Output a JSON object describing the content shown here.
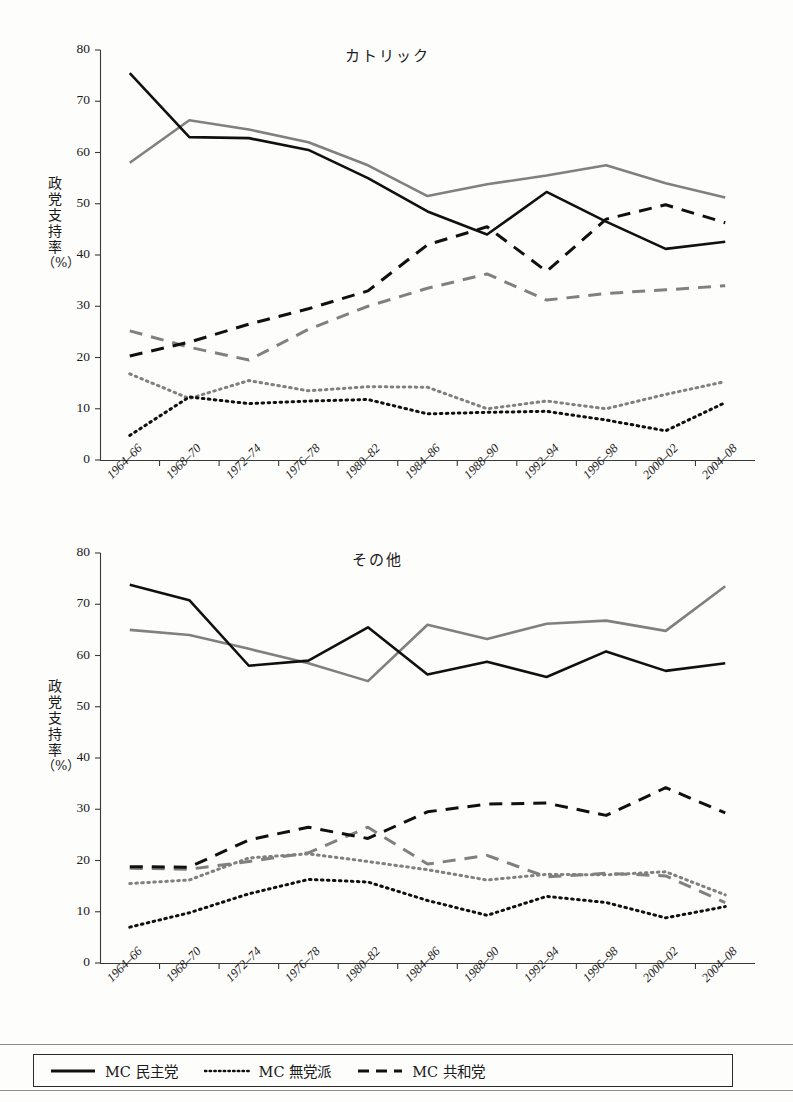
{
  "figure": {
    "axis_color": "#3a3a3a",
    "series_black": "#101010",
    "series_gray": "#808080"
  },
  "legend": {
    "items": [
      {
        "label": "MC 民主党",
        "style": "solid",
        "icon": "solid-line-icon"
      },
      {
        "label": "MC 無党派",
        "style": "dotted",
        "icon": "dotted-line-icon"
      },
      {
        "label": "MC 共和党",
        "style": "dashed",
        "icon": "dashed-line-icon"
      }
    ]
  },
  "axis": {
    "ylabel_chars": [
      "政",
      "党",
      "支",
      "持",
      "率"
    ],
    "ylabel_unit": "（%）",
    "yticks": [
      80,
      70,
      60,
      50,
      40,
      30,
      20,
      10,
      0
    ],
    "categories": [
      "1964–66",
      "1968–70",
      "1972–74",
      "1976–78",
      "1980–82",
      "1984–86",
      "1988–90",
      "1992–94",
      "1996–98",
      "2000–02",
      "2004–08"
    ]
  },
  "chart_data": [
    {
      "type": "line",
      "title": "カトリック",
      "xlabel": "",
      "ylabel": "政党支持率（%）",
      "ylim": [
        0,
        80
      ],
      "xlim_categories": [
        "1964–66",
        "1968–70",
        "1972–74",
        "1976–78",
        "1980–82",
        "1984–86",
        "1988–90",
        "1992–94",
        "1996–98",
        "2000–02",
        "2004–08"
      ],
      "grid": false,
      "legend_position": "below-figure",
      "series": [
        {
          "name": "MC 民主党",
          "group": "black",
          "style": "solid",
          "values": [
            75.5,
            63.0,
            62.8,
            60.5,
            55.0,
            48.5,
            44.0,
            52.3,
            46.5,
            41.2,
            42.6
          ]
        },
        {
          "name": "MC 民主党",
          "group": "gray",
          "style": "solid",
          "values": [
            58.0,
            66.3,
            64.5,
            62.0,
            57.5,
            51.5,
            53.8,
            55.5,
            57.5,
            54.0,
            51.2
          ]
        },
        {
          "name": "MC 共和党",
          "group": "black",
          "style": "dashed",
          "values": [
            20.3,
            23.0,
            26.5,
            29.5,
            33.0,
            42.0,
            45.5,
            36.8,
            47.0,
            49.8,
            46.3
          ]
        },
        {
          "name": "MC 共和党",
          "group": "gray",
          "style": "dashed",
          "values": [
            25.2,
            22.0,
            19.5,
            25.5,
            30.0,
            33.5,
            36.3,
            31.2,
            32.5,
            33.2,
            34.0
          ]
        },
        {
          "name": "MC 無党派",
          "group": "black",
          "style": "dotted",
          "values": [
            4.8,
            12.3,
            11.0,
            11.5,
            11.8,
            9.0,
            9.3,
            9.5,
            7.8,
            5.7,
            11.2
          ]
        },
        {
          "name": "MC 無党派",
          "group": "gray",
          "style": "dotted",
          "values": [
            16.8,
            12.0,
            15.5,
            13.5,
            14.3,
            14.2,
            10.0,
            11.5,
            10.0,
            12.8,
            15.3
          ]
        }
      ]
    },
    {
      "type": "line",
      "title": "その他",
      "xlabel": "",
      "ylabel": "政党支持率（%）",
      "ylim": [
        0,
        80
      ],
      "xlim_categories": [
        "1964–66",
        "1968–70",
        "1972–74",
        "1976–78",
        "1980–82",
        "1984–86",
        "1988–90",
        "1992–94",
        "1996–98",
        "2000–02",
        "2004–08"
      ],
      "grid": false,
      "legend_position": "below-figure",
      "series": [
        {
          "name": "MC 民主党",
          "group": "black",
          "style": "solid",
          "values": [
            73.8,
            70.8,
            58.0,
            59.0,
            65.5,
            56.3,
            58.8,
            55.8,
            60.8,
            57.0,
            58.5
          ]
        },
        {
          "name": "MC 民主党",
          "group": "gray",
          "style": "solid",
          "values": [
            65.0,
            64.0,
            61.3,
            58.5,
            55.0,
            66.0,
            63.2,
            66.2,
            66.8,
            64.8,
            73.5
          ]
        },
        {
          "name": "MC 共和党",
          "group": "black",
          "style": "dashed",
          "values": [
            18.8,
            18.7,
            24.0,
            26.5,
            24.3,
            29.5,
            31.0,
            31.2,
            28.8,
            34.2,
            29.3
          ]
        },
        {
          "name": "MC 共和党",
          "group": "gray",
          "style": "dashed",
          "values": [
            18.5,
            18.3,
            19.8,
            21.5,
            26.5,
            19.3,
            21.0,
            16.8,
            17.5,
            17.0,
            11.8
          ]
        },
        {
          "name": "MC 無党派",
          "group": "black",
          "style": "dotted",
          "values": [
            7.0,
            9.8,
            13.5,
            16.3,
            15.8,
            12.2,
            9.3,
            13.0,
            11.8,
            8.8,
            11.0
          ]
        },
        {
          "name": "MC 無党派",
          "group": "gray",
          "style": "dotted",
          "values": [
            15.5,
            16.2,
            20.5,
            21.3,
            19.8,
            18.2,
            16.2,
            17.3,
            17.2,
            17.8,
            13.3
          ]
        }
      ]
    }
  ]
}
